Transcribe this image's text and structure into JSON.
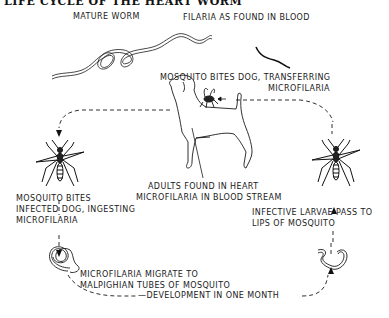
{
  "diagram": {
    "title": "LIFE CYCLE OF THE HEART WORM",
    "labels": {
      "mature_worm": "MATURE WORM",
      "filaria_blood": "FILARIA AS FOUND IN BLOOD",
      "mosquito_bites_dog_1": "MOSQUITO BITES DOG, TRANSFERRING",
      "mosquito_bites_dog_2": "MICROFILARIA",
      "mosquito_bites_infected_1": "MOSQUITO BITES",
      "mosquito_bites_infected_2": "INFECTED DOG, INGESTING",
      "mosquito_bites_infected_3": "MICROFILARIA",
      "adults_heart_1": "ADULTS FOUND IN HEART",
      "adults_heart_2": "MICROFILARIA IN BLOOD STREAM",
      "infective_larvae_1": "INFECTIVE LARVAE PASS TO",
      "infective_larvae_2": "LIPS OF MOSQUITO",
      "migrate_1": "MICROFILARIA MIGRATE TO",
      "migrate_2": "MALPIGHIAN TUBES OF MOSQUITO",
      "development": "—DEVELOPMENT IN ONE MONTH"
    },
    "illustrations": [
      "mature-worm",
      "filaria-in-blood",
      "dog",
      "mosquito-on-dog",
      "mosquito-left",
      "mosquito-right",
      "microfilaria-coiled",
      "infective-larva"
    ],
    "colors": {
      "ink": "#1a1a1a",
      "background": "#ffffff"
    }
  }
}
